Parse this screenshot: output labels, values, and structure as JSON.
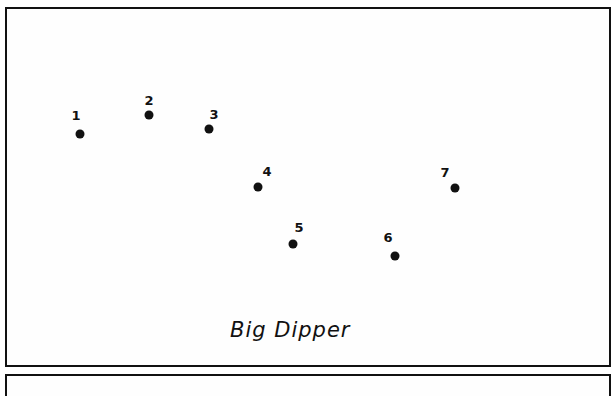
{
  "diagram": {
    "title": "Big Dipper",
    "stars": [
      {
        "label": "1",
        "x": 80,
        "y": 134,
        "lx": 76,
        "ly": 115
      },
      {
        "label": "2",
        "x": 149,
        "y": 115,
        "lx": 149,
        "ly": 100
      },
      {
        "label": "3",
        "x": 209,
        "y": 129,
        "lx": 214,
        "ly": 114
      },
      {
        "label": "4",
        "x": 258,
        "y": 187,
        "lx": 267,
        "ly": 171
      },
      {
        "label": "5",
        "x": 293,
        "y": 244,
        "lx": 299,
        "ly": 227
      },
      {
        "label": "6",
        "x": 395,
        "y": 256,
        "lx": 388,
        "ly": 237
      },
      {
        "label": "7",
        "x": 455,
        "y": 188,
        "lx": 445,
        "ly": 172
      }
    ]
  }
}
